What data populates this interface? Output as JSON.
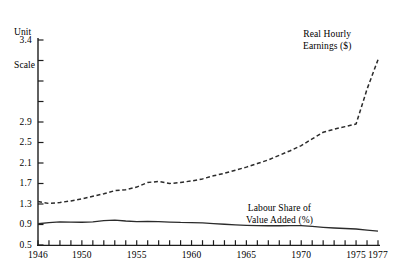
{
  "chart_data": {
    "type": "line",
    "title": "",
    "subtitle": "",
    "ylabel_lines": [
      "Unit",
      "Scale"
    ],
    "xlabel": "",
    "grid": false,
    "legend_position": "inline-annotations",
    "y_tick_labels": [
      "3.4",
      "2.9",
      "2.5",
      "2.1",
      "1.7",
      "1.3",
      "0.9",
      "0.5"
    ],
    "y_tick_values": [
      3.4,
      2.9,
      2.5,
      2.1,
      1.7,
      1.3,
      0.9,
      0.5
    ],
    "y_minor_tick_count_between_34_and_29": 3,
    "ylim": [
      0.5,
      3.4
    ],
    "x_tick_labels": [
      "1946",
      "1950",
      "1955",
      "1960",
      "1965",
      "1970",
      "1975",
      "1977"
    ],
    "x_tick_values": [
      1946,
      1950,
      1955,
      1960,
      1965,
      1970,
      1975,
      1977
    ],
    "x_minor_ticks_every_year": true,
    "xlim": [
      1946,
      1977
    ],
    "annotations": [
      {
        "id": "earnings",
        "lines": [
          "Real Hourly",
          "Earnings ($)"
        ],
        "x": 1973,
        "y": 3.3
      },
      {
        "id": "labour",
        "lines": [
          "Labour Share of",
          "Value Added (%)"
        ],
        "x": 1968.5,
        "y": 0.85
      }
    ],
    "series": [
      {
        "name": "Real Hourly Earnings ($)",
        "style": "dashed",
        "color": "#2b2b2b",
        "x": [
          1946,
          1947,
          1948,
          1949,
          1950,
          1951,
          1952,
          1953,
          1954,
          1955,
          1956,
          1957,
          1958,
          1959,
          1960,
          1961,
          1962,
          1963,
          1964,
          1965,
          1966,
          1967,
          1968,
          1969,
          1970,
          1971,
          1972,
          1973,
          1974,
          1975,
          1976,
          1977
        ],
        "values": [
          1.35,
          1.31,
          1.33,
          1.36,
          1.4,
          1.45,
          1.5,
          1.56,
          1.58,
          1.63,
          1.72,
          1.74,
          1.7,
          1.72,
          1.75,
          1.79,
          1.85,
          1.9,
          1.96,
          2.02,
          2.09,
          2.16,
          2.25,
          2.34,
          2.44,
          2.57,
          2.7,
          2.76,
          2.81,
          2.86,
          3.1,
          3.28
        ]
      },
      {
        "name": "Labour Share of Value Added (%)",
        "style": "solid",
        "color": "#2b2b2b",
        "x": [
          1946,
          1947,
          1948,
          1949,
          1950,
          1951,
          1952,
          1953,
          1954,
          1955,
          1956,
          1957,
          1958,
          1959,
          1960,
          1961,
          1962,
          1963,
          1964,
          1965,
          1966,
          1967,
          1968,
          1969,
          1970,
          1971,
          1972,
          1973,
          1974,
          1975,
          1976,
          1977
        ],
        "values": [
          0.915,
          0.935,
          0.95,
          0.948,
          0.944,
          0.952,
          0.975,
          0.985,
          0.968,
          0.958,
          0.962,
          0.958,
          0.948,
          0.94,
          0.938,
          0.93,
          0.918,
          0.905,
          0.893,
          0.884,
          0.878,
          0.876,
          0.876,
          0.878,
          0.88,
          0.862,
          0.845,
          0.832,
          0.822,
          0.812,
          0.79,
          0.77
        ]
      }
    ]
  },
  "plot_geometry": {
    "left_px": 38,
    "right_px": 378,
    "top_value": 3.4,
    "top_px": 40,
    "bottom_value": 0.5,
    "bottom_px": 245
  }
}
